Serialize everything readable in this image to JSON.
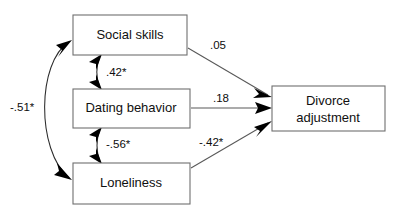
{
  "diagram": {
    "type": "path-diagram",
    "title": "",
    "background_color": "#ffffff",
    "box_stroke_color": "#6f6f6f",
    "line_color": "#585858",
    "arrow_color": "#000000",
    "text_color": "#101010",
    "nodes": [
      {
        "id": "social_skills",
        "label": "Social skills"
      },
      {
        "id": "dating_behavior",
        "label": "Dating behavior"
      },
      {
        "id": "loneliness",
        "label": "Loneliness"
      },
      {
        "id": "divorce_adjustment",
        "label_line1": "Divorce",
        "label_line2": "adjustment"
      }
    ],
    "paths": [
      {
        "id": "social_to_divorce",
        "from": "social_skills",
        "to": "divorce_adjustment",
        "coefficient": ".05",
        "significant": false,
        "style": "directed"
      },
      {
        "id": "dating_to_divorce",
        "from": "dating_behavior",
        "to": "divorce_adjustment",
        "coefficient": ".18",
        "significant": false,
        "style": "directed"
      },
      {
        "id": "loneliness_to_divorce",
        "from": "loneliness",
        "to": "divorce_adjustment",
        "coefficient": "-.42*",
        "significant": true,
        "style": "directed"
      },
      {
        "id": "social_dating_corr",
        "from": "social_skills",
        "to": "dating_behavior",
        "coefficient": ".42*",
        "significant": true,
        "style": "double-headed"
      },
      {
        "id": "dating_loneliness_corr",
        "from": "dating_behavior",
        "to": "loneliness",
        "coefficient": "-.56*",
        "significant": true,
        "style": "double-headed"
      },
      {
        "id": "social_loneliness_corr",
        "from": "social_skills",
        "to": "loneliness",
        "coefficient": "-.51*",
        "significant": true,
        "style": "double-headed-curved"
      }
    ]
  }
}
